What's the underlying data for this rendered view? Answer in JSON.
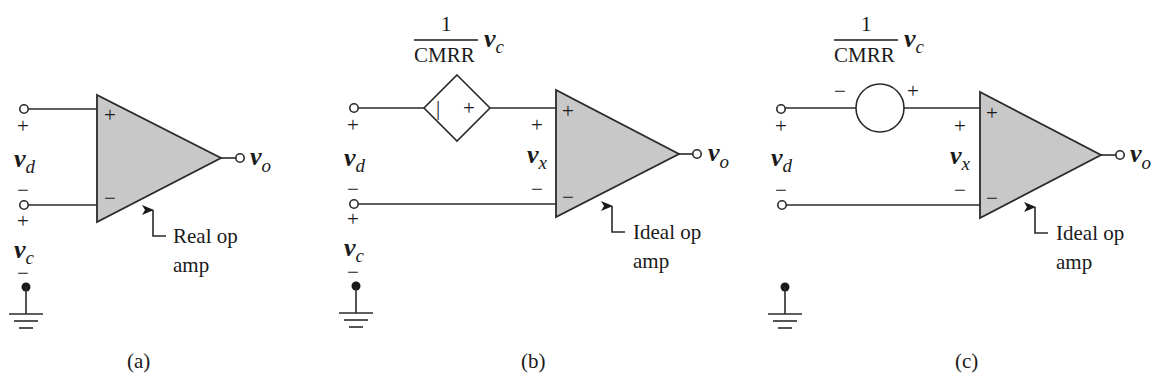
{
  "figure": {
    "colors": {
      "opamp_fill": "#c8c8c8",
      "line": "#2a2a2a",
      "background": "#ffffff"
    },
    "panels": [
      {
        "caption": "(a)",
        "input_plus_sign": "+",
        "input_minus_sign": "−",
        "vd_var": "v",
        "vd_sub": "d",
        "vc_plus_sign": "+",
        "vc_minus_sign": "−",
        "vc_var": "v",
        "vc_sub": "c",
        "opamp_plus": "+",
        "opamp_minus": "−",
        "out_var": "v",
        "out_sub": "o",
        "note_line1": "Real op",
        "note_line2": "amp"
      },
      {
        "caption": "(b)",
        "frac_num": "1",
        "frac_den": "CMRR",
        "frac_var": "v",
        "frac_sub": "c",
        "source_type": "dependent-voltage-source",
        "source_left_sign": "|",
        "source_right_sign": "+",
        "input_plus_sign": "+",
        "input_minus_sign": "−",
        "vd_var": "v",
        "vd_sub": "d",
        "vc_plus_sign": "+",
        "vc_minus_sign": "−",
        "vc_var": "v",
        "vc_sub": "c",
        "vx_plus_sign": "+",
        "vx_minus_sign": "−",
        "vx_var": "v",
        "vx_sub": "x",
        "opamp_plus": "+",
        "opamp_minus": "−",
        "out_var": "v",
        "out_sub": "o",
        "note_line1": "Ideal op",
        "note_line2": "amp"
      },
      {
        "caption": "(c)",
        "frac_num": "1",
        "frac_den": "CMRR",
        "frac_var": "v",
        "frac_sub": "c",
        "source_type": "independent-voltage-source",
        "source_left_sign": "−",
        "source_right_sign": "+",
        "input_plus_sign": "+",
        "input_minus_sign": "−",
        "vd_var": "v",
        "vd_sub": "d",
        "vx_plus_sign": "+",
        "vx_minus_sign": "−",
        "vx_var": "v",
        "vx_sub": "x",
        "opamp_plus": "+",
        "opamp_minus": "−",
        "out_var": "v",
        "out_sub": "o",
        "note_line1": "Ideal op",
        "note_line2": "amp"
      }
    ]
  }
}
